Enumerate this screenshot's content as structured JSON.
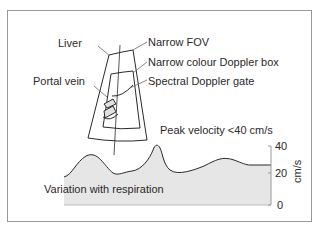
{
  "diagram": {
    "labels": {
      "liver": "Liver",
      "narrow_fov": "Narrow FOV",
      "colour_box": "Narrow colour Doppler box",
      "portal_vein": "Portal vein",
      "spectral_gate": "Spectral Doppler gate",
      "peak_velocity": "Peak velocity <40 cm/s",
      "variation": "Variation with respiration"
    },
    "spectral_axis": {
      "unit": "cm/s",
      "ticks": [
        "40",
        "20",
        "0"
      ]
    },
    "colors": {
      "frame": "#9a9a9a",
      "line": "#2a2a2a",
      "spectrum_fill": "#e6e6e6"
    }
  }
}
